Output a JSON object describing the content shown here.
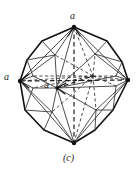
{
  "figure": {
    "caption": "(c)",
    "labels": {
      "top_axis": "a",
      "left_axis": "a",
      "center_axis": "a"
    },
    "colors": {
      "outline": "#111111",
      "interior_solid": "#555555",
      "hidden_dashed": "#333333",
      "background": "#ffffff",
      "text": "#1a1a1a"
    },
    "geometry": {
      "description": "Crystal form drawing: octahedron combined with a trapezohedron, drawn in clinographic projection with solid visible edges and dashed hidden edges; three crystallographic a-axes shown dashed through the centre.",
      "vertices": {
        "top": [
          74,
          27
        ],
        "bottom": [
          74,
          143
        ],
        "left": [
          20,
          81
        ],
        "right": [
          128,
          80
        ],
        "front": [
          57,
          88
        ],
        "back": [
          93,
          76
        ]
      },
      "outline_polygon": [
        [
          74,
          27
        ],
        [
          107,
          41
        ],
        [
          122,
          62
        ],
        [
          128,
          80
        ],
        [
          113,
          110
        ],
        [
          95,
          130
        ],
        [
          74,
          143
        ],
        [
          44,
          130
        ],
        [
          25,
          110
        ],
        [
          20,
          81
        ],
        [
          27,
          60
        ],
        [
          42,
          41
        ]
      ]
    }
  }
}
